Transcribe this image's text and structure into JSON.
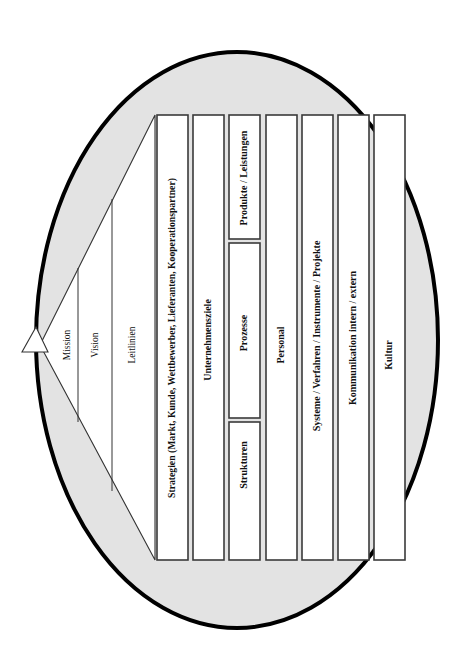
{
  "diagram": {
    "language": "de",
    "shape": "ellipse",
    "colors": {
      "ellipse_fill": "#e3e3e3",
      "ellipse_stroke": "#000000",
      "box_fill": "#ffffff",
      "box_stroke": "#4a4a4a",
      "text": "#111111",
      "wedge_fill": "#ffffff",
      "wedge_stroke": "#333333"
    },
    "wedge": {
      "name": "vision-wedge",
      "bands": [
        {
          "id": "mission",
          "label": "Mission"
        },
        {
          "id": "vision",
          "label": "Vision"
        },
        {
          "id": "leitlinien",
          "label": "Leitlinien"
        }
      ]
    },
    "columns": [
      {
        "id": "strategien",
        "label": "Strategien (Markt, Kunde, Wettbewerber, Lieferanten, Kooperationspartner)",
        "style": "long"
      },
      {
        "id": "unternehmensziele",
        "label": "Unternehmensziele",
        "style": "col"
      },
      {
        "id": "struktur-gruppe",
        "label": "",
        "style": "group",
        "subboxes": [
          {
            "id": "produkte-leistungen",
            "label": "Produkte / Leistungen"
          },
          {
            "id": "prozesse",
            "label": "Prozesse"
          },
          {
            "id": "strukturen",
            "label": "Strukturen"
          }
        ]
      },
      {
        "id": "personal",
        "label": "Personal",
        "style": "col"
      },
      {
        "id": "systeme",
        "label": "Systeme / Verfahren / Instrumente / Projekte",
        "style": "col"
      },
      {
        "id": "kommunikation",
        "label": "Kommunikation intern / extern",
        "style": "col"
      },
      {
        "id": "kultur",
        "label": "Kultur",
        "style": "col"
      }
    ]
  }
}
